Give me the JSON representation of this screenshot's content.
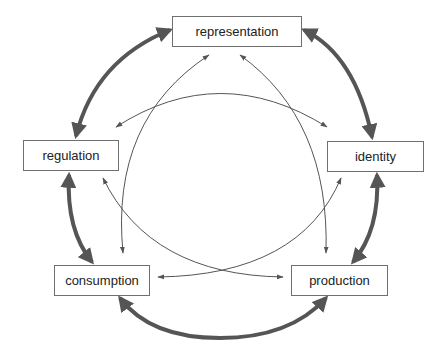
{
  "diagram": {
    "type": "cycle",
    "nodes": [
      {
        "id": "representation",
        "label": "representation"
      },
      {
        "id": "identity",
        "label": "identity"
      },
      {
        "id": "production",
        "label": "production"
      },
      {
        "id": "consumption",
        "label": "consumption"
      },
      {
        "id": "regulation",
        "label": "regulation"
      }
    ],
    "outer_links": [
      {
        "from": "representation",
        "to": "identity",
        "style": "thick",
        "direction": "both"
      },
      {
        "from": "identity",
        "to": "production",
        "style": "thick",
        "direction": "both"
      },
      {
        "from": "production",
        "to": "consumption",
        "style": "thick",
        "direction": "both"
      },
      {
        "from": "consumption",
        "to": "regulation",
        "style": "thick",
        "direction": "both"
      },
      {
        "from": "regulation",
        "to": "representation",
        "style": "thick",
        "direction": "both"
      }
    ],
    "inner_links": [
      {
        "from": "representation",
        "to": "consumption",
        "style": "thin",
        "direction": "both"
      },
      {
        "from": "representation",
        "to": "production",
        "style": "thin",
        "direction": "both"
      },
      {
        "from": "regulation",
        "to": "identity",
        "style": "thin",
        "direction": "both"
      },
      {
        "from": "regulation",
        "to": "production",
        "style": "thin",
        "direction": "both"
      },
      {
        "from": "identity",
        "to": "consumption",
        "style": "thin",
        "direction": "both"
      }
    ],
    "colors": {
      "thick": "#555555",
      "thin": "#555555",
      "box_border": "#6f6f6f",
      "text": "#222222"
    }
  }
}
